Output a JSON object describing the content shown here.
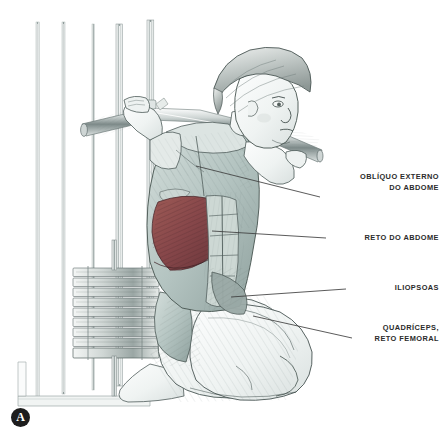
{
  "illustration": {
    "title": "Agachamento ajoelhado no Smith machine — anatomia muscular",
    "subject": "Mulher ajoelhada com barra guiada sobre os ombros",
    "style": "desenho a lapis anatomico",
    "background_color": "#ffffff",
    "line_color": "#3a3a3a",
    "highlight_muscle_color": "#8a4a48",
    "muscle_tone_color": "#b9c9c6",
    "skin_tone_color": "#f2f4f3"
  },
  "callouts": [
    {
      "id": "obliquo-externo-do-abdome",
      "label": "OBLÍQUO EXTERNO\nDO ABDOME",
      "line_start": {
        "x": 320,
        "y": 197
      },
      "line_end": {
        "x": 196,
        "y": 166
      }
    },
    {
      "id": "reto-do-abdome",
      "label": "RETO DO ABDOME",
      "line_start": {
        "x": 326,
        "y": 238
      },
      "line_end": {
        "x": 212,
        "y": 231
      }
    },
    {
      "id": "iliopsoas",
      "label": "ILIOPSOAS",
      "line_start": {
        "x": 346,
        "y": 289
      },
      "line_end": {
        "x": 231,
        "y": 297
      }
    },
    {
      "id": "quadriceps-reto-femoral",
      "label": "QUADRÍCEPS,\nRETO FEMORAL",
      "line_start": {
        "x": 352,
        "y": 338
      },
      "line_end": {
        "x": 253,
        "y": 316
      }
    }
  ],
  "logo": {
    "letter": "A",
    "shape": "circle",
    "background_color": "#1d1d1d",
    "text_color": "#ffffff"
  },
  "equipment": {
    "name": "smith-machine",
    "parts": [
      "vertical-guide-rail-left",
      "vertical-guide-rail-right",
      "barbell",
      "weight-stack",
      "base-frame"
    ],
    "weight_plate_count": 9
  }
}
